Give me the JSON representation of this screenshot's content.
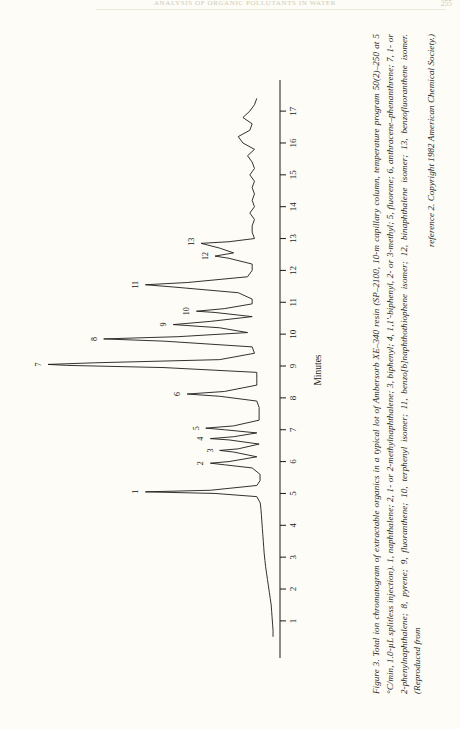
{
  "page": {
    "running_head": "ANALYSIS OF ORGANIC POLLUTANTS IN WATER",
    "folio": "255"
  },
  "figure": {
    "label": "Figure 3.",
    "caption": "Figure 3.  Total ion chromatogram of extractable organics in a typical lot of Ambersorb XE–340 resin (SP–2100, 10-m capillary column, temperature program 50(2)–250 at 5 °C/min, 1.0-µL splitless injection). 1, naphthalene; 2, 1- or 2-methylnaphthalene; 3, biphenyl; 4, 1,1'-biphenyl; 2- or 3-methyl; 5, fluorene; 6, anthracene–phenanthrene; 7, 1- or 2-phenylnaphthalene; 8, pyrene; 9, fluoranthene; 10, terphenyl isomer; 11, benzo[b]naphthothiophene isomer; 12, binaphthalene isomer; 13, benzofluoranthene isomer. (Reproduced from reference 2. Copyright 1982 American Chemical Society.)",
    "caption_lines": [
      "Figure 3.   Total ion chromatogram of extractable organics in a typical lot of Ambersorb XE–340 resin (SP–2100, 10-m capillary column,",
      "temperature program 50(2)–250 at 5 °C/min, 1.0-µL splitless injection). 1, naphthalene; 2, 1- or 2-methylnaphthalene; 3, biphenyl; 4,",
      "1,1'-biphenyl, 2- or 3-methyl; 5, fluorene; 6, anthracene–phenanthrene; 7, 1- or 2-phenylnaphthalene; 8, pyrene; 9, fluoranthene; 10,",
      "terphenyl isomer; 11, benzo[b]naphthothiophene isomer; 12, binaphthalene isomer; 13, benzofluoranthene isomer. (Reproduced from",
      "reference 2. Copyright 1982 American Chemical Society.)"
    ]
  },
  "chart_data": {
    "type": "line",
    "xlabel": "Minutes",
    "ylabel": "",
    "xlim": [
      0.4,
      17.6
    ],
    "ylim": [
      0,
      100
    ],
    "grid": false,
    "legend": "none",
    "orientation": "rotated-90",
    "tick_labels": [
      "1",
      "2",
      "3",
      "4",
      "5",
      "6",
      "7",
      "8",
      "9",
      "10",
      "11",
      "12",
      "13",
      "14",
      "15",
      "16",
      "17"
    ],
    "tick_values": [
      1,
      2,
      3,
      4,
      5,
      6,
      7,
      8,
      9,
      10,
      11,
      12,
      13,
      14,
      15,
      16,
      17
    ],
    "peak_annotations": [
      {
        "id": "1",
        "label": "1",
        "minutes": 5.05,
        "height": 58
      },
      {
        "id": "2",
        "label": "2",
        "minutes": 5.95,
        "height": 30
      },
      {
        "id": "3",
        "label": "3",
        "minutes": 6.35,
        "height": 26
      },
      {
        "id": "4",
        "label": "4",
        "minutes": 6.72,
        "height": 30
      },
      {
        "id": "5",
        "label": "5",
        "minutes": 7.05,
        "height": 32
      },
      {
        "id": "6",
        "label": "6",
        "minutes": 8.12,
        "height": 40
      },
      {
        "id": "7",
        "label": "7",
        "minutes": 9.05,
        "height": 100
      },
      {
        "id": "8",
        "label": "8",
        "minutes": 9.85,
        "height": 76
      },
      {
        "id": "9",
        "label": "9",
        "minutes": 10.3,
        "height": 46
      },
      {
        "id": "10",
        "label": "10",
        "minutes": 10.72,
        "height": 36
      },
      {
        "id": "11",
        "label": "11",
        "minutes": 11.55,
        "height": 58
      },
      {
        "id": "12",
        "label": "12",
        "minutes": 12.45,
        "height": 28
      },
      {
        "id": "13",
        "label": "13",
        "minutes": 12.9,
        "height": 34
      }
    ],
    "series": [
      {
        "name": "total ion current",
        "x": [
          0.5,
          0.7,
          0.9,
          1.1,
          1.3,
          1.5,
          1.7,
          1.9,
          2.1,
          2.3,
          2.5,
          2.7,
          2.9,
          3.1,
          3.3,
          3.5,
          3.7,
          3.9,
          4.1,
          4.3,
          4.5,
          4.7,
          4.9,
          5.0,
          5.05,
          5.1,
          5.25,
          5.4,
          5.6,
          5.8,
          5.9,
          5.95,
          6.0,
          6.15,
          6.3,
          6.35,
          6.4,
          6.55,
          6.68,
          6.72,
          6.78,
          6.9,
          7.0,
          7.05,
          7.12,
          7.3,
          7.5,
          7.7,
          7.9,
          8.05,
          8.12,
          8.2,
          8.4,
          8.6,
          8.8,
          8.95,
          9.02,
          9.05,
          9.1,
          9.2,
          9.4,
          9.6,
          9.78,
          9.85,
          9.92,
          10.05,
          10.2,
          10.3,
          10.4,
          10.55,
          10.68,
          10.72,
          10.8,
          10.95,
          11.1,
          11.3,
          11.48,
          11.55,
          11.62,
          11.8,
          12.0,
          12.2,
          12.38,
          12.45,
          12.55,
          12.7,
          12.85,
          12.9,
          13.0,
          13.2,
          13.4,
          13.6,
          13.8,
          14.0,
          14.2,
          14.4,
          14.6,
          14.8,
          15.0,
          15.2,
          15.4,
          15.6,
          15.8,
          16.0,
          16.2,
          16.4,
          16.6,
          16.8,
          17.0,
          17.2,
          17.4
        ],
        "y": [
          3,
          3,
          3.2,
          3.4,
          3.6,
          3.8,
          4.2,
          4.6,
          5,
          5.4,
          5.8,
          6.2,
          6.5,
          6.8,
          7,
          7.2,
          7.4,
          7.6,
          7.8,
          8,
          8.2,
          8.5,
          10,
          28,
          58,
          30,
          10,
          8.6,
          8.6,
          12,
          24,
          30,
          22,
          10,
          20,
          26,
          18,
          9,
          22,
          30,
          20,
          10,
          24,
          32,
          20,
          9,
          9,
          9,
          10,
          26,
          40,
          24,
          10,
          10,
          10,
          50,
          92,
          100,
          80,
          26,
          11,
          12,
          50,
          76,
          44,
          14,
          26,
          46,
          30,
          12,
          28,
          36,
          24,
          12,
          12,
          18,
          46,
          58,
          40,
          14,
          12,
          12,
          22,
          28,
          20,
          26,
          34,
          22,
          11,
          12,
          12,
          11,
          13,
          11,
          12,
          11,
          12,
          11,
          13,
          11,
          12,
          14,
          11,
          16,
          18,
          13,
          12,
          16,
          13,
          11,
          10
        ]
      }
    ]
  }
}
